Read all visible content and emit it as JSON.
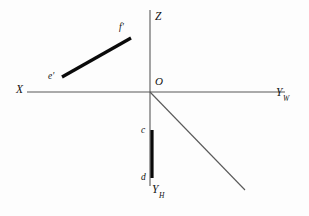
{
  "figure": {
    "background_color": "#fdfdfd",
    "axis_color": "#595959",
    "segment_color": "#0a0a0a"
  },
  "axes": [
    {
      "id": "x-axis",
      "label": "X",
      "subscript": "",
      "label_x": 16,
      "label_y": 84,
      "x1": 27,
      "y1": 92,
      "x2": 285,
      "y2": 92
    },
    {
      "id": "yw-axis",
      "label": "Y",
      "subscript": "W",
      "label_x": 276,
      "label_y": 87,
      "x1": 27,
      "y1": 92,
      "x2": 285,
      "y2": 92
    },
    {
      "id": "z-axis",
      "label": "Z",
      "subscript": "",
      "label_x": 155,
      "label_y": 11,
      "x1": 150,
      "y1": 10,
      "x2": 150,
      "y2": 186
    },
    {
      "id": "yh-axis",
      "label": "Y",
      "subscript": "H",
      "label_x": 152,
      "label_y": 184,
      "x1": 150,
      "y1": 92,
      "x2": 245,
      "y2": 190
    }
  ],
  "origin": {
    "label": "O",
    "label_x": 155,
    "label_y": 76,
    "x": 150,
    "y": 92
  },
  "segments": [
    {
      "id": "ef-prime",
      "name": "frontal-projection-segment",
      "x1": 62,
      "y1": 77,
      "x2": 131,
      "y2": 38,
      "endpoints": [
        {
          "label": "e'",
          "label_x": 48,
          "label_y": 72
        },
        {
          "label": "f'",
          "label_x": 119,
          "label_y": 23
        }
      ]
    },
    {
      "id": "cd",
      "name": "horizontal-projection-segment",
      "x1": 152,
      "y1": 130,
      "x2": 152,
      "y2": 178,
      "endpoints": [
        {
          "label": "c",
          "label_x": 141,
          "label_y": 126
        },
        {
          "label": "d",
          "label_x": 141,
          "label_y": 173
        }
      ]
    }
  ]
}
